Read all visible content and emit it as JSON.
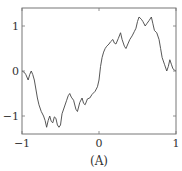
{
  "chart_data": {
    "type": "line",
    "title": "",
    "caption": "(A)",
    "xlabel": "",
    "ylabel": "",
    "xlim": [
      -1,
      1
    ],
    "ylim": [
      -1.4,
      1.4
    ],
    "grid": false,
    "legend": null,
    "xticks": [
      -1,
      0,
      1
    ],
    "xtick_labels": [
      "−1",
      "0",
      "1"
    ],
    "yticks": [
      -1,
      0,
      1
    ],
    "ytick_labels": [
      "−1",
      "0",
      "1"
    ],
    "line_color": "#444444",
    "frame_color": "#777777",
    "series": [
      {
        "name": "curve",
        "x": [
          -1.0,
          -0.97,
          -0.95,
          -0.92,
          -0.9,
          -0.88,
          -0.86,
          -0.84,
          -0.82,
          -0.8,
          -0.78,
          -0.75,
          -0.72,
          -0.7,
          -0.68,
          -0.66,
          -0.64,
          -0.62,
          -0.6,
          -0.58,
          -0.56,
          -0.54,
          -0.52,
          -0.5,
          -0.48,
          -0.45,
          -0.42,
          -0.4,
          -0.38,
          -0.36,
          -0.33,
          -0.3,
          -0.28,
          -0.25,
          -0.22,
          -0.2,
          -0.18,
          -0.15,
          -0.12,
          -0.09,
          -0.05,
          -0.02,
          0.0,
          0.02,
          0.04,
          0.06,
          0.08,
          0.1,
          0.13,
          0.15,
          0.18,
          0.2,
          0.22,
          0.25,
          0.28,
          0.3,
          0.33,
          0.35,
          0.38,
          0.4,
          0.43,
          0.46,
          0.48,
          0.5,
          0.52,
          0.55,
          0.57,
          0.6,
          0.62,
          0.65,
          0.68,
          0.7,
          0.72,
          0.75,
          0.78,
          0.8,
          0.82,
          0.85,
          0.88,
          0.9,
          0.92,
          0.94,
          0.96,
          0.98,
          1.0
        ],
        "y": [
          0.0,
          -0.03,
          -0.08,
          -0.2,
          -0.08,
          0.0,
          -0.08,
          -0.2,
          -0.4,
          -0.6,
          -0.75,
          -0.9,
          -1.0,
          -1.1,
          -1.25,
          -1.1,
          -1.0,
          -1.12,
          -1.15,
          -1.02,
          -1.05,
          -1.2,
          -1.25,
          -1.2,
          -0.95,
          -0.8,
          -0.65,
          -0.55,
          -0.5,
          -0.58,
          -0.65,
          -0.85,
          -0.9,
          -0.7,
          -0.6,
          -0.72,
          -0.75,
          -0.62,
          -0.6,
          -0.52,
          -0.45,
          -0.35,
          -0.2,
          0.1,
          0.3,
          0.42,
          0.5,
          0.55,
          0.6,
          0.65,
          0.7,
          0.62,
          0.6,
          0.72,
          0.85,
          0.7,
          0.55,
          0.5,
          0.62,
          0.7,
          0.78,
          0.88,
          0.95,
          1.1,
          1.2,
          1.15,
          1.1,
          1.0,
          1.05,
          1.12,
          1.2,
          1.05,
          0.9,
          0.85,
          0.7,
          0.5,
          0.3,
          0.15,
          0.0,
          0.1,
          0.25,
          0.15,
          0.05,
          0.02,
          0.0
        ]
      }
    ]
  }
}
